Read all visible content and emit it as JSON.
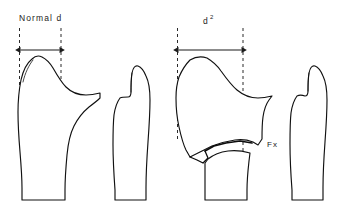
{
  "panels": [
    {
      "id": "normal",
      "label": "Normal d",
      "label_superscript": "",
      "measurement_caption": "Normal d",
      "bones": [
        {
          "name": "tibia",
          "texture": "dense-stipple"
        },
        {
          "name": "fibula",
          "texture": "medium-stipple"
        }
      ],
      "guides": [
        {
          "name": "left-guide-line",
          "x": 19,
          "y_top": 28,
          "y_bottom": 141
        },
        {
          "name": "right-guide-line",
          "x": 61,
          "y_top": 28,
          "y_bottom": 198
        }
      ],
      "dimension": {
        "x_start": 19,
        "x_end": 61,
        "y": 50,
        "width_px": 42
      }
    },
    {
      "id": "fractured",
      "label": "d",
      "label_superscript": "2",
      "measurement_caption": "d 2",
      "fracture_label": "Fx",
      "bones": [
        {
          "name": "tibia-fractured",
          "texture": "dense-stipple"
        },
        {
          "name": "fibula",
          "texture": "light-stipple"
        }
      ],
      "guides": [
        {
          "name": "left-guide-line",
          "x": 177,
          "y_top": 28,
          "y_bottom": 141
        },
        {
          "name": "right-guide-line",
          "x": 243,
          "y_top": 28,
          "y_bottom": 198
        }
      ],
      "dimension": {
        "x_start": 177,
        "x_end": 243,
        "y": 50,
        "width_px": 66
      }
    }
  ],
  "colors": {
    "ink": "#1b1b1b",
    "outline": "#111111",
    "guide": "#2a2a2a",
    "background": "#ffffff",
    "stipple": "#1a1a1a"
  }
}
